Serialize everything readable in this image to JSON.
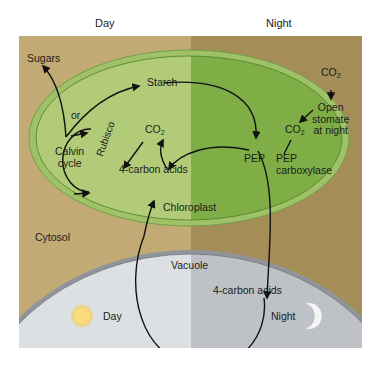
{
  "header": {
    "day": "Day",
    "night": "Night"
  },
  "colors": {
    "cytosol_day": "#c2aa74",
    "cytosol_night": "#a58d58",
    "chloroplast_day": "#b1cb78",
    "chloroplast_night": "#7fae46",
    "chloroplast_border": "#6fa04a",
    "vacuole_day": "#dde0e3",
    "vacuole_night": "#bec2c6",
    "arrow": "#111111"
  },
  "labels": {
    "sugars": "Sugars",
    "or": "or",
    "starch": "Starch",
    "co2_top": "CO",
    "co2_mid": "CO",
    "co2_right": "CO",
    "co2_sub": "2",
    "open_stomate": [
      "Open",
      "stomate",
      "at night"
    ],
    "calvin_cycle": [
      "Calvin",
      "cycle"
    ],
    "rubisco": "Rubisco",
    "four_carbon_acids_chloroplast": "4-carbon acids",
    "pep": "PEP",
    "pep_carboxylase": [
      "PEP",
      "carboxylase"
    ],
    "chloroplast": "Chloroplast",
    "cytosol": "Cytosol",
    "vacuole": "Vacuole",
    "four_carbon_acids_vacuole": "4-carbon acids",
    "day": "Day",
    "night": "Night"
  },
  "icons": {
    "sun": "sun-icon",
    "moon": "crescent-moon-icon"
  }
}
